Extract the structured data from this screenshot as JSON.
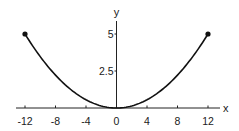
{
  "chart_data": {
    "type": "line",
    "title": "",
    "xlabel": "x",
    "ylabel": "y",
    "xlim": [
      -13.5,
      13.5
    ],
    "ylim": [
      0,
      6
    ],
    "x_ticks": [
      -12,
      -8,
      -4,
      0,
      4,
      8,
      12
    ],
    "x_tick_labels": [
      "-12",
      "-8",
      "-4",
      "0",
      "4",
      "8",
      "12"
    ],
    "y_ticks": [
      2.5,
      5
    ],
    "y_tick_labels": [
      "2.5",
      "5"
    ],
    "grid": false,
    "legend": null,
    "series": [
      {
        "name": "y = 5x²/144",
        "x": [
          -12,
          -10,
          -8,
          -6,
          -4,
          -2,
          0,
          2,
          4,
          6,
          8,
          10,
          12
        ],
        "y": [
          5,
          3.47,
          2.22,
          1.25,
          0.56,
          0.14,
          0,
          0.14,
          0.56,
          1.25,
          2.22,
          3.47,
          5
        ]
      }
    ],
    "endpoints": [
      {
        "x": -12,
        "y": 5
      },
      {
        "x": 12,
        "y": 5
      }
    ]
  },
  "colors": {
    "curve": "#111111",
    "axis": "#222222",
    "background": "#ffffff"
  }
}
